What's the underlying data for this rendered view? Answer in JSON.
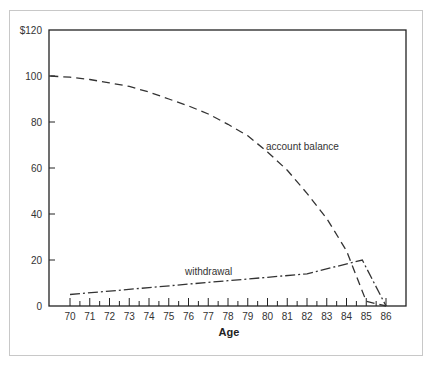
{
  "chart_data": {
    "type": "line",
    "title": "",
    "xlabel": "Age",
    "ylabel": "",
    "xlim": [
      69,
      87
    ],
    "ylim": [
      0,
      120
    ],
    "x_ticks": [
      70,
      71,
      72,
      73,
      74,
      75,
      76,
      77,
      78,
      79,
      80,
      81,
      82,
      83,
      84,
      85,
      86
    ],
    "y_ticks": [
      0,
      20,
      40,
      60,
      80,
      100,
      120
    ],
    "y_tick_labels": [
      "0",
      "20",
      "40",
      "60",
      "80",
      "100",
      "$120"
    ],
    "grid": false,
    "legend": "none (inline annotations)",
    "series": [
      {
        "name": "account balance",
        "style": "dashed",
        "x": [
          69,
          70,
          71,
          72,
          73,
          74,
          75,
          76,
          77,
          78,
          79,
          80,
          81,
          82,
          83,
          84,
          85,
          86
        ],
        "values": [
          100,
          99.5,
          98.5,
          97,
          95.5,
          93,
          90,
          87,
          83.5,
          79,
          74,
          67,
          59,
          49,
          38,
          24,
          2,
          0
        ]
      },
      {
        "name": "withdrawal",
        "style": "dash-dot",
        "x": [
          70,
          72,
          74,
          76,
          78,
          80,
          82,
          84.8,
          86
        ],
        "values": [
          5,
          6.5,
          8,
          9.5,
          11,
          12.5,
          14,
          20,
          0
        ]
      }
    ],
    "annotations": [
      {
        "text": "account balance",
        "x": 80,
        "y": 70
      },
      {
        "text": "withdrawal",
        "x": 76.5,
        "y": 17
      }
    ]
  }
}
